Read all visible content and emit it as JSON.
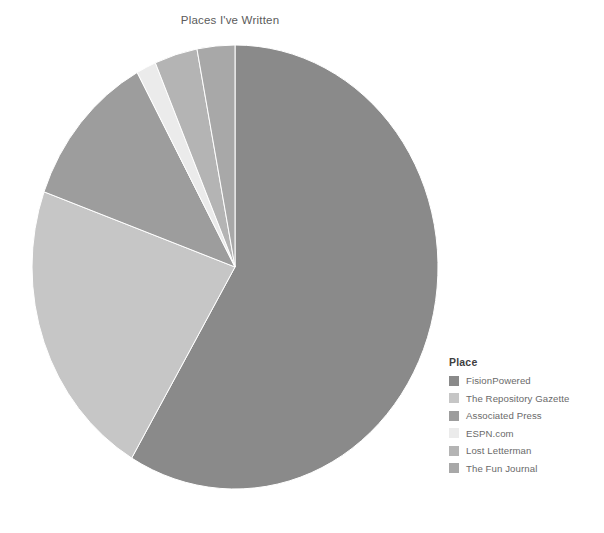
{
  "chart_data": {
    "type": "pie",
    "title": "Places I've Written",
    "legend_title": "Place",
    "legend_position": "right",
    "grid": false,
    "categories": [
      "FisionPowered",
      "The Repository Gazette",
      "Associated Press",
      "ESPN.com",
      "Lost Letterman",
      "The Fun Journal"
    ],
    "values": [
      58.5,
      22.0,
      11.5,
      1.6,
      3.4,
      3.0
    ],
    "colors": [
      "#8a8a8a",
      "#c6c6c6",
      "#9d9d9d",
      "#ebebeb",
      "#b4b4b4",
      "#a8a8a8"
    ],
    "slices": [
      {
        "label": "FisionPowered",
        "value": 58.5,
        "color": "#8a8a8a",
        "start_angle": 0.0,
        "end_angle": 210.6
      },
      {
        "label": "The Repository Gazette",
        "value": 22.0,
        "color": "#c6c6c6",
        "start_angle": 210.6,
        "end_angle": 289.8
      },
      {
        "label": "Associated Press",
        "value": 11.5,
        "color": "#9d9d9d",
        "start_angle": 289.8,
        "end_angle": 331.2
      },
      {
        "label": "ESPN.com",
        "value": 1.6,
        "color": "#ebebeb",
        "start_angle": 331.2,
        "end_angle": 336.9
      },
      {
        "label": "Lost Letterman",
        "value": 3.4,
        "color": "#b4b4b4",
        "start_angle": 336.9,
        "end_angle": 349.2
      },
      {
        "label": "The Fun Journal",
        "value": 3.0,
        "color": "#a8a8a8",
        "start_angle": 349.2,
        "end_angle": 360.0
      }
    ],
    "xlabel": "",
    "ylabel": ""
  },
  "legend": {
    "title": "Place",
    "items": [
      {
        "label": "FisionPowered",
        "color": "#8a8a8a"
      },
      {
        "label": "The Repository Gazette",
        "color": "#c6c6c6"
      },
      {
        "label": "Associated Press",
        "color": "#9d9d9d"
      },
      {
        "label": "ESPN.com",
        "color": "#ebebeb"
      },
      {
        "label": "Lost Letterman",
        "color": "#b4b4b4"
      },
      {
        "label": "The Fun Journal",
        "color": "#a8a8a8"
      }
    ]
  }
}
